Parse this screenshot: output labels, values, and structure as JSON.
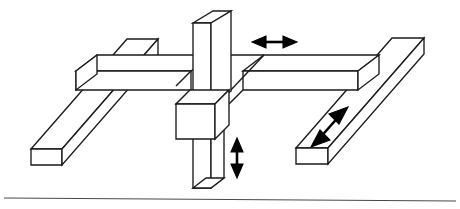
{
  "figure": {
    "title": "Three-Axis Gantry Motion Diagram",
    "background_color": "#ffffff",
    "line_color": "#1a1a1a",
    "ground_line_color": "#4a4a4a",
    "arrow_color": "#000000"
  },
  "parts": {
    "left_rail": {
      "name": "Left base rail",
      "orientation": "depth-diagonal"
    },
    "right_rail": {
      "name": "Right base rail",
      "orientation": "depth-diagonal"
    },
    "cross_beam_left": {
      "name": "Cross beam left segment",
      "orientation": "horizontal"
    },
    "cross_beam_right": {
      "name": "Cross beam right segment",
      "orientation": "horizontal"
    },
    "vertical_column": {
      "name": "Vertical column",
      "orientation": "vertical"
    },
    "carriage_block": {
      "name": "Carriage block",
      "orientation": "center-junction"
    },
    "ground_line": {
      "name": "Ground reference line",
      "orientation": "horizontal"
    }
  },
  "arrows": {
    "horizontal": {
      "name": "Horizontal travel arrow",
      "axis": "X",
      "style": "double-headed",
      "direction": "left-right"
    },
    "vertical": {
      "name": "Vertical travel arrow",
      "axis": "Z",
      "style": "double-headed",
      "direction": "up-down"
    },
    "diagonal": {
      "name": "Depth travel arrow",
      "axis": "Y",
      "style": "double-headed",
      "direction": "diagonal-depth"
    }
  }
}
